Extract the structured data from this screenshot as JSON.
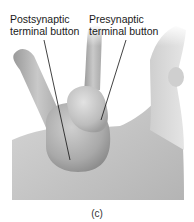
{
  "figure": {
    "labels": {
      "postsynaptic": [
        "Postsynaptic",
        "terminal button"
      ],
      "presynaptic": [
        "Presynaptic",
        "terminal button"
      ]
    },
    "caption": "(c)"
  },
  "colors": {
    "background": "#ffffff",
    "surface": "#bdbdbd",
    "surface_light": "#e0e0e0",
    "surface_dark": "#8a8a8a",
    "text": "#1a1a1a",
    "leader_line": "#111111"
  }
}
